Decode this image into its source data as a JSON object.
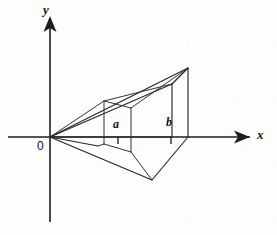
{
  "figure": {
    "title": "",
    "background_color": "#fdfdfc",
    "ink_color": "#1c1c1c",
    "axes": {
      "x_label": "x",
      "y_label": "y",
      "origin_label": "0",
      "x_axis": {
        "x1": 8,
        "y1": 137,
        "x2": 250,
        "y2": 137
      },
      "y_axis": {
        "x1": 50,
        "y1": 222,
        "x2": 50,
        "y2": 16
      },
      "x_arrow": "M250,137 L236,131.5 L239,137 L236,142.5 Z",
      "y_arrow": "M50,16 L44.5,30 L50,27 L55.5,30 Z"
    },
    "ticks": [
      {
        "name": "tick-a",
        "x": 118,
        "y_top": 137,
        "y_bottom": 143
      },
      {
        "name": "tick-b",
        "x": 171,
        "y_top": 137,
        "y_bottom": 143
      }
    ],
    "point_labels": [
      {
        "name": "label-a",
        "text": "a",
        "x": 113,
        "y": 121
      },
      {
        "name": "label-b",
        "text": "b",
        "x": 166,
        "y": 119
      }
    ],
    "axis_labels": [
      {
        "name": "label-x",
        "text": "x",
        "x": 257,
        "y": 131
      },
      {
        "name": "label-y",
        "text": "y",
        "x": 43,
        "y": 5
      },
      {
        "name": "label-origin",
        "text": "0",
        "x": 38,
        "y": 141
      }
    ],
    "solid": {
      "description": "perspective wedge with square cross-sections perpendicular to x-axis, apex at origin",
      "apex": {
        "x": 50,
        "y": 137
      },
      "cross_section_a": {
        "top_back": {
          "x": 118,
          "y": 98
        },
        "top_front": {
          "x": 131,
          "y": 108
        },
        "bottom_front": {
          "x": 131,
          "y": 152
        },
        "bottom_back": {
          "x": 118,
          "y": 141
        },
        "left_back": {
          "x": 104,
          "y": 101
        },
        "left_bottom": {
          "x": 104,
          "y": 144
        }
      },
      "cross_section_b": {
        "top_back": {
          "x": 172,
          "y": 84
        },
        "top_apex": {
          "x": 188,
          "y": 68
        },
        "bottom_front": {
          "x": 188,
          "y": 137
        },
        "bottom_back": {
          "x": 172,
          "y": 137
        },
        "front_bottom": {
          "x": 152,
          "y": 180
        }
      },
      "edges": [
        {
          "name": "edge-apex-to-b-top",
          "d": "M50,137 L188,68"
        },
        {
          "name": "edge-apex-to-b-backtop",
          "d": "M50,137 L172,84"
        },
        {
          "name": "edge-b-top-to-b-backtop",
          "d": "M188,68 L172,84"
        },
        {
          "name": "edge-b-right-vertical",
          "d": "M188,68 L188,137"
        },
        {
          "name": "edge-b-back-vertical",
          "d": "M172,84 L172,137"
        },
        {
          "name": "edge-apex-to-b-bottomback",
          "d": "M50,137 L172,137"
        },
        {
          "name": "edge-apex-to-front-bottom",
          "d": "M50,137 L152,180"
        },
        {
          "name": "edge-front-bottom-to-b-right",
          "d": "M152,180 L188,137"
        },
        {
          "name": "edge-apex-lower-left",
          "d": "M50,137 L98,146"
        },
        {
          "name": "edge-cross-a-top",
          "d": "M104,101 L131,108"
        },
        {
          "name": "edge-cross-a-topback-vert",
          "d": "M104,101 L104,144"
        },
        {
          "name": "edge-cross-a-right-vert",
          "d": "M131,108 L131,152"
        },
        {
          "name": "edge-cross-a-bottom",
          "d": "M104,144 L131,152"
        },
        {
          "name": "edge-apex-to-a-topback",
          "d": "M50,137 L104,101"
        },
        {
          "name": "edge-a-topback-to-b-topback",
          "d": "M104,101 L172,84"
        },
        {
          "name": "edge-a-right-to-b-right",
          "d": "M131,108 L188,68"
        },
        {
          "name": "edge-a-bottomfront-to-front-bottom",
          "d": "M131,152 L152,180"
        },
        {
          "name": "edge-a-bottomback-to-axis",
          "d": "M104,144 L98,146"
        }
      ]
    }
  }
}
